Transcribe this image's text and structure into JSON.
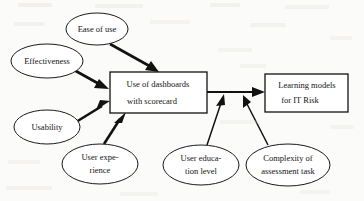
{
  "diagram": {
    "type": "concept-map",
    "colors": {
      "background": "#fbfbf9",
      "stroke": "#121212",
      "node_fill": "#ffffff",
      "text": "#141414"
    },
    "nodes": {
      "ease_of_use": {
        "id": "ease-of-use",
        "shape": "ellipse",
        "lines": [
          "Ease of use"
        ],
        "cx": 97,
        "cy": 29,
        "rx": 31,
        "ry": 16
      },
      "effectiveness": {
        "id": "effectiveness",
        "shape": "ellipse",
        "lines": [
          "Effectiveness"
        ],
        "cx": 47,
        "cy": 61,
        "rx": 36,
        "ry": 17
      },
      "usability": {
        "id": "usability",
        "shape": "ellipse",
        "lines": [
          "Usability"
        ],
        "cx": 47,
        "cy": 127,
        "rx": 33,
        "ry": 17
      },
      "user_experience": {
        "id": "user-experience",
        "shape": "ellipse",
        "lines": [
          "User expe-",
          "rience"
        ],
        "cx": 100,
        "cy": 164,
        "rx": 38,
        "ry": 20
      },
      "user_education_level": {
        "id": "user-education-level",
        "shape": "ellipse",
        "lines": [
          "User educa-",
          "tion level"
        ],
        "cx": 201,
        "cy": 165,
        "rx": 38,
        "ry": 20
      },
      "complexity_of_assessment_task": {
        "id": "complexity-of-assessment-task",
        "shape": "ellipse",
        "lines": [
          "Complexity of",
          "assessment task"
        ],
        "cx": 288,
        "cy": 165,
        "rx": 42,
        "ry": 21
      },
      "use_of_dashboards": {
        "id": "use-of-dashboards-with-scorecard",
        "shape": "rectangle",
        "lines": [
          "Use of dashboards",
          "with scorecard"
        ],
        "x": 110,
        "y": 72,
        "width": 97,
        "height": 41
      },
      "learning_models": {
        "id": "learning-models-for-it-risk",
        "shape": "rectangle",
        "lines": [
          "Learning models",
          "for IT Risk"
        ],
        "x": 265,
        "y": 74,
        "width": 83,
        "height": 38
      }
    },
    "edges": [
      {
        "id": "ease-of-use-to-dashboards",
        "from": "ease_of_use",
        "to": "use_of_dashboards",
        "weight": "thick",
        "arrow": "end"
      },
      {
        "id": "effectiveness-to-dashboards",
        "from": "effectiveness",
        "to": "use_of_dashboards",
        "weight": "thick",
        "arrow": "end"
      },
      {
        "id": "usability-to-dashboards",
        "from": "usability",
        "to": "use_of_dashboards",
        "weight": "thick",
        "arrow": "end"
      },
      {
        "id": "user-experience-to-dashboards",
        "from": "user_experience",
        "to": "use_of_dashboards",
        "weight": "thick",
        "arrow": "end"
      },
      {
        "id": "dashboards-to-learning-models",
        "from": "use_of_dashboards",
        "to": "learning_models",
        "weight": "connector",
        "arrow": "end"
      },
      {
        "id": "user-education-level-to-connector",
        "from": "user_education_level",
        "to": "dashboards-to-learning-models",
        "weight": "thin",
        "arrow": "end"
      },
      {
        "id": "complexity-of-assessment-task-to-connector",
        "from": "complexity_of_assessment_task",
        "to": "dashboards-to-learning-models",
        "weight": "thin",
        "arrow": "end"
      }
    ]
  }
}
